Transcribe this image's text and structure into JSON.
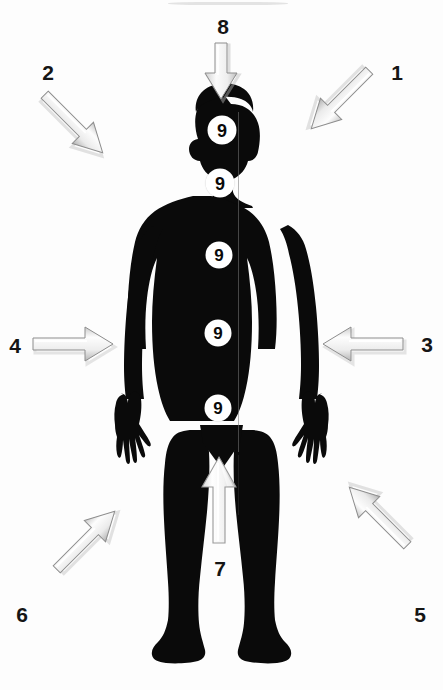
{
  "image": {
    "title": "Human body silhouette with eight directional arrows and five numbered body points",
    "background_color": "#fdfdfd",
    "figure_color": "#0a0a0a",
    "arrow_fill_color": "#f2f2f2",
    "arrow_stroke_color": "#8d8d8d",
    "label_color": "#151515",
    "point_fill_color": "#ffffff",
    "point_text_color": "#0a0a0a",
    "width": 443,
    "height": 690
  },
  "labels": [
    {
      "id": "label-1",
      "text": "1",
      "x": 397,
      "y": 72
    },
    {
      "id": "label-2",
      "text": "2",
      "x": 48,
      "y": 72
    },
    {
      "id": "label-3",
      "text": "3",
      "x": 427,
      "y": 344
    },
    {
      "id": "label-4",
      "text": "4",
      "x": 15,
      "y": 345
    },
    {
      "id": "label-5",
      "text": "5",
      "x": 420,
      "y": 614
    },
    {
      "id": "label-6",
      "text": "6",
      "x": 22,
      "y": 614
    },
    {
      "id": "label-7",
      "text": "7",
      "x": 220,
      "y": 568
    },
    {
      "id": "label-8",
      "text": "8",
      "x": 223,
      "y": 26
    }
  ],
  "arrows": [
    {
      "id": "arrow-1",
      "label": "1",
      "direction": "down-left",
      "x": 315,
      "y": 88,
      "rotation": 135,
      "length": 74
    },
    {
      "id": "arrow-2",
      "label": "2",
      "direction": "down-right",
      "x": 60,
      "y": 86,
      "rotation": 45,
      "length": 76
    },
    {
      "id": "arrow-3",
      "label": "3",
      "direction": "left",
      "x": 320,
      "y": 330,
      "rotation": 180,
      "length": 80
    },
    {
      "id": "arrow-4",
      "label": "4",
      "direction": "right",
      "x": 32,
      "y": 330,
      "rotation": 0,
      "length": 80
    },
    {
      "id": "arrow-5",
      "label": "5",
      "direction": "up-left",
      "x": 327,
      "y": 505,
      "rotation": 225,
      "length": 76
    },
    {
      "id": "arrow-6",
      "label": "6",
      "direction": "up-right",
      "x": 46,
      "y": 505,
      "rotation": 315,
      "length": 76
    },
    {
      "id": "arrow-7",
      "label": "7",
      "direction": "up",
      "x": 205,
      "y": 455,
      "rotation": 270,
      "length": 88
    },
    {
      "id": "arrow-8",
      "label": "8",
      "direction": "down",
      "x": 207,
      "y": 42,
      "rotation": 90,
      "length": 72
    }
  ],
  "body_points": [
    {
      "id": "point-head",
      "text": "9",
      "x": 222,
      "y": 130,
      "diameter": 29,
      "region": "head"
    },
    {
      "id": "point-neck",
      "text": "9",
      "x": 220,
      "y": 183,
      "diameter": 29,
      "region": "neck"
    },
    {
      "id": "point-chest",
      "text": "9",
      "x": 219,
      "y": 255,
      "diameter": 27,
      "region": "chest"
    },
    {
      "id": "point-abdomen",
      "text": "9",
      "x": 218,
      "y": 333,
      "diameter": 27,
      "region": "abdomen"
    },
    {
      "id": "point-pelvis",
      "text": "9",
      "x": 218,
      "y": 408,
      "diameter": 27,
      "region": "pelvis"
    }
  ]
}
